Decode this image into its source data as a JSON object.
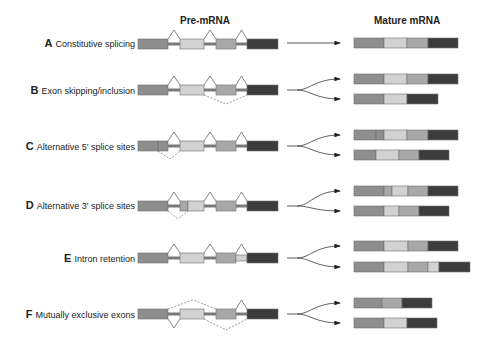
{
  "headers": {
    "pre": "Pre-mRNA",
    "mature": "Mature mRNA"
  },
  "colors": {
    "exon1": "#8e8e8e",
    "exon2": "#d2d2d2",
    "exon3": "#a8a8a8",
    "exon4": "#3c3c3c",
    "intron": "#7a7a7a",
    "outline": "#6e6e6e"
  },
  "rows": [
    {
      "letter": "A",
      "label": "Constitutive splicing"
    },
    {
      "letter": "B",
      "label": "Exon skipping/inclusion"
    },
    {
      "letter": "C",
      "label": "Alternative 5′ splice sites"
    },
    {
      "letter": "D",
      "label": "Alternative 3′ splice sites"
    },
    {
      "letter": "E",
      "label": "Intron retention"
    },
    {
      "letter": "F",
      "label": "Mutually exclusive exons"
    }
  ]
}
